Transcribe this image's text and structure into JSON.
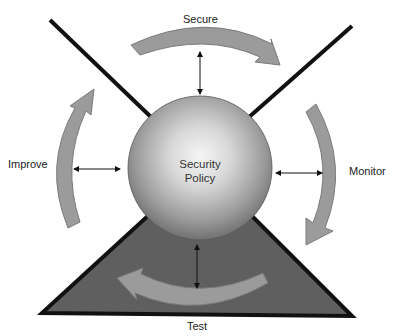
{
  "diagram": {
    "center": {
      "label_line1": "Security",
      "label_line2": "Policy"
    },
    "stages": [
      {
        "id": "secure",
        "label": "Secure"
      },
      {
        "id": "monitor",
        "label": "Monitor"
      },
      {
        "id": "test",
        "label": "Test"
      },
      {
        "id": "improve",
        "label": "Improve"
      }
    ],
    "colors": {
      "background": "#ffffff",
      "arrow_fill": "#999999",
      "arrow_stroke": "#7a7a7a",
      "line": "#111111",
      "triangle_fill": "#5e5e5e",
      "sphere_light": "#f4f4f4",
      "sphere_dark": "#6a6a6a"
    }
  }
}
